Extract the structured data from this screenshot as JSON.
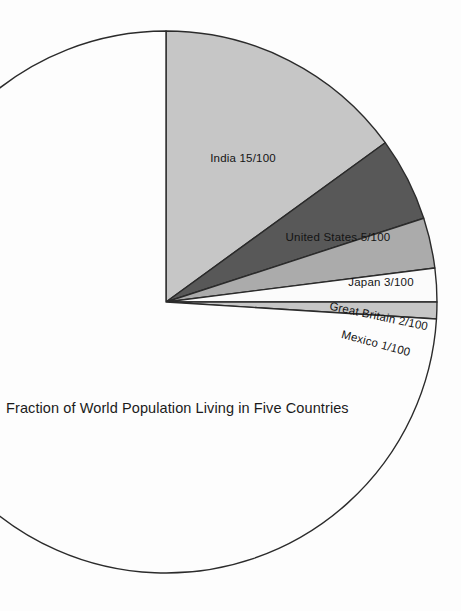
{
  "figure": {
    "caption": "Fraction of World Population Living in Five Countries",
    "background_color": "#fdfdfd",
    "outline_color": "#2b2b2b"
  },
  "chart_data": {
    "type": "pie",
    "title": "Fraction of World Population Living in Five Countries",
    "units": "fraction of 100",
    "total": 100,
    "start_angle_deg": 0,
    "direction": "clockwise",
    "center_px": {
      "x": 166,
      "y": 302
    },
    "radius_px": 271,
    "labels": [
      "India 15/100",
      "United States 5/100",
      "Japan 3/100",
      "Great Britain 2/100",
      "Mexico 1/100"
    ],
    "categories": [
      "India",
      "United States",
      "Japan",
      "Great Britain",
      "Mexico",
      "Rest of World"
    ],
    "values": [
      15,
      5,
      3,
      2,
      1,
      74
    ],
    "colors": [
      "#c6c6c6",
      "#585858",
      "#ababab",
      "#fbfbfb",
      "#c6c6c6",
      "#fdfdfd"
    ],
    "slices": [
      {
        "name": "India",
        "label": "India 15/100",
        "value": 15,
        "color": "#c6c6c6",
        "angle_deg": 54,
        "label_rotation_deg": 0,
        "label_x": 243,
        "label_y": 162
      },
      {
        "name": "United States",
        "label": "United States 5/100",
        "value": 5,
        "color": "#585858",
        "angle_deg": 18,
        "label_rotation_deg": 0,
        "label_x": 338,
        "label_y": 241
      },
      {
        "name": "Japan",
        "label": "Japan 3/100",
        "value": 3,
        "color": "#ababab",
        "angle_deg": 10.8,
        "label_rotation_deg": 0,
        "label_x": 381,
        "label_y": 286
      },
      {
        "name": "Great Britain",
        "label": "Great Britain 2/100",
        "value": 2,
        "color": "#fbfbfb",
        "angle_deg": 7.2,
        "label_rotation_deg": 12,
        "label_x": 378,
        "label_y": 320
      },
      {
        "name": "Mexico",
        "label": "Mexico 1/100",
        "value": 1,
        "color": "#c6c6c6",
        "angle_deg": 3.6,
        "label_rotation_deg": 15,
        "label_x": 375,
        "label_y": 347
      },
      {
        "name": "Rest of World",
        "label": "",
        "value": 74,
        "color": "#fdfdfd",
        "angle_deg": 266.4,
        "label_rotation_deg": 0,
        "label_x": 0,
        "label_y": 0
      }
    ],
    "legend": "none",
    "grid": false
  }
}
